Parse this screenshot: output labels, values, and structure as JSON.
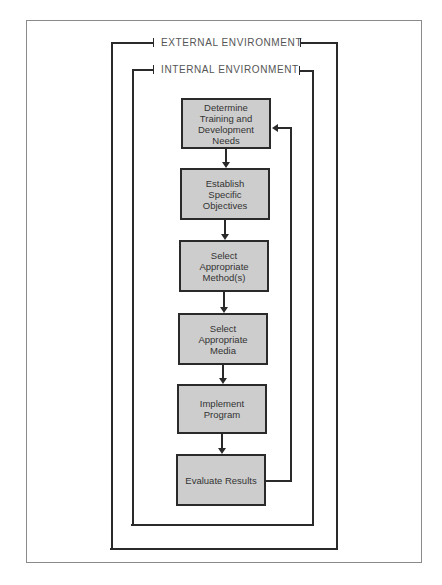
{
  "diagram": {
    "external_label": "EXTERNAL ENVIRONMENT",
    "internal_label": "INTERNAL ENVIRONMENT",
    "steps": [
      {
        "label": "Determine Training and Development Needs"
      },
      {
        "label": "Establish Specific Objectives"
      },
      {
        "label": "Select Appropriate Method(s)"
      },
      {
        "label": "Select Appropriate Media"
      },
      {
        "label": "Implement Program"
      },
      {
        "label": "Evaluate Results"
      }
    ],
    "feedback": {
      "from": "Evaluate Results",
      "to": "Determine Training and Development Needs"
    },
    "colors": {
      "box_fill": "#cdcdcd",
      "line": "#2a2a2a",
      "border": "#8a8a8a"
    }
  }
}
